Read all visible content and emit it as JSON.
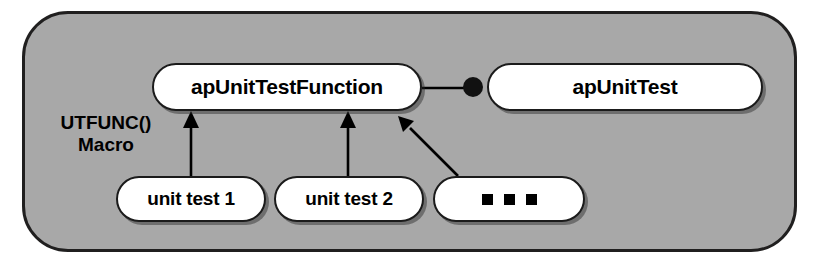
{
  "diagram": {
    "container": {
      "name": "grouping-frame",
      "fill_color": "#a8a8a8",
      "border_color": "#201f1f"
    },
    "nodes": [
      {
        "id": "ap-unit-test-function",
        "label": "apUnitTestFunction"
      },
      {
        "id": "ap-unit-test",
        "label": "apUnitTest"
      },
      {
        "id": "unit-test-1",
        "label": "unit test 1"
      },
      {
        "id": "unit-test-2",
        "label": "unit test 2"
      },
      {
        "id": "ellipsis",
        "label": "",
        "marker": "three-squares"
      }
    ],
    "labels": {
      "macro": "UTFUNC()\nMacro"
    },
    "edges": [
      {
        "from": "unit-test-1",
        "to": "ap-unit-test-function",
        "style": "solid",
        "arrowhead": "filled-triangle",
        "meaning": "generalization"
      },
      {
        "from": "unit-test-2",
        "to": "ap-unit-test-function",
        "style": "solid",
        "arrowhead": "filled-triangle",
        "meaning": "generalization"
      },
      {
        "from": "ellipsis",
        "to": "ap-unit-test-function",
        "style": "solid",
        "arrowhead": "filled-triangle",
        "meaning": "generalization"
      },
      {
        "from": "ap-unit-test-function",
        "to": "ap-unit-test",
        "style": "solid",
        "arrowhead": "filled-circle",
        "meaning": "association"
      }
    ],
    "colors": {
      "node_fill": "#ffffff",
      "node_border": "#1b1b1b",
      "line": "#000000",
      "text": "#000000"
    }
  }
}
